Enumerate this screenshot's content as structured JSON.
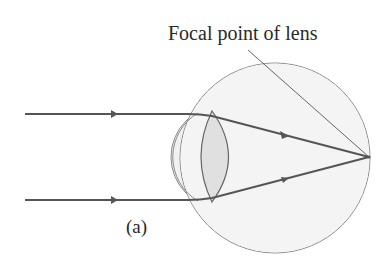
{
  "figure": {
    "labels": {
      "focal_point": "Focal point of lens",
      "part": "(a)"
    },
    "elements": [
      "eyeball",
      "cornea",
      "lens",
      "incoming-parallel-ray-top",
      "incoming-parallel-ray-bottom",
      "focal-point-leader-line"
    ],
    "colors": {
      "eyeball_fill": "#f3f3f3",
      "outline": "#777777",
      "lens_fill": "#e2e2e2",
      "ray": "#555555",
      "text": "#2a2a2a"
    }
  }
}
